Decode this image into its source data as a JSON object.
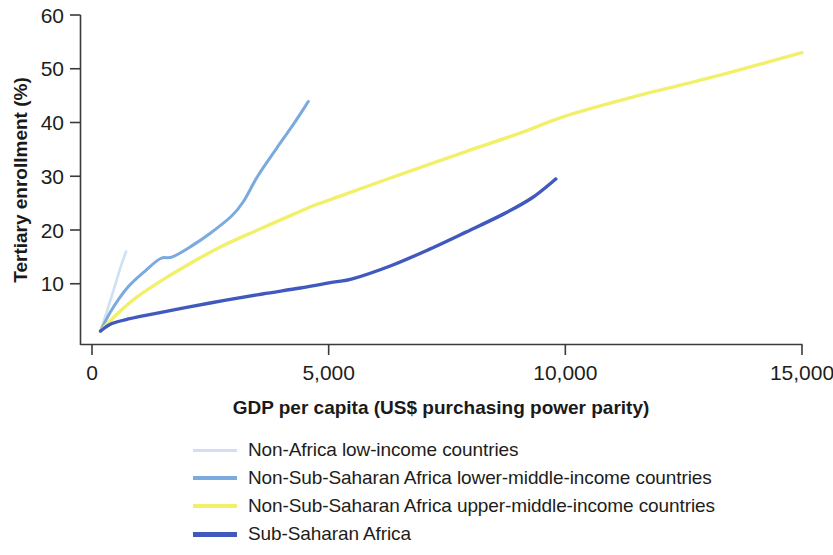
{
  "chart_data": {
    "type": "line",
    "title": "",
    "xlabel": "GDP per capita (US$ purchasing power parity)",
    "ylabel": "Tertiary enrollment (%)",
    "xlim": [
      0,
      15000
    ],
    "ylim": [
      0,
      60
    ],
    "xticks": [
      0,
      5000,
      10000,
      15000
    ],
    "xtick_labels": [
      "0",
      "5,000",
      "10,000",
      "15,000"
    ],
    "yticks": [
      10,
      20,
      30,
      40,
      50,
      60
    ],
    "ytick_labels": [
      "10",
      "20",
      "30",
      "40",
      "50",
      "60"
    ],
    "grid": false,
    "legend_position": "below",
    "series": [
      {
        "name": "Non-Africa low-income countries",
        "color": "#cfe0f5",
        "width": 2.6,
        "points": [
          [
            180,
            1.2
          ],
          [
            320,
            5.0
          ],
          [
            480,
            9.5
          ],
          [
            620,
            13.5
          ],
          [
            720,
            16.0
          ]
        ]
      },
      {
        "name": "Non-Sub-Saharan Africa lower-middle-income countries",
        "color": "#7aaade",
        "width": 3.0,
        "points": [
          [
            180,
            1.2
          ],
          [
            420,
            5.2
          ],
          [
            760,
            9.4
          ],
          [
            1150,
            12.6
          ],
          [
            1450,
            14.7
          ],
          [
            1700,
            15.0
          ],
          [
            2100,
            17.0
          ],
          [
            2500,
            19.4
          ],
          [
            2950,
            22.6
          ],
          [
            3200,
            25.3
          ],
          [
            3500,
            30.0
          ],
          [
            3900,
            35.2
          ],
          [
            4250,
            39.6
          ],
          [
            4570,
            43.9
          ]
        ]
      },
      {
        "name": "Non-Sub-Saharan Africa upper-middle-income countries",
        "color": "#f2f06a",
        "width": 3.4,
        "points": [
          [
            180,
            1.2
          ],
          [
            520,
            4.3
          ],
          [
            900,
            7.2
          ],
          [
            1400,
            10.2
          ],
          [
            2000,
            13.4
          ],
          [
            2700,
            16.8
          ],
          [
            3500,
            20.0
          ],
          [
            4300,
            23.1
          ],
          [
            4700,
            24.6
          ],
          [
            5400,
            26.8
          ],
          [
            6600,
            30.6
          ],
          [
            7900,
            34.6
          ],
          [
            9100,
            38.2
          ],
          [
            10000,
            41.2
          ],
          [
            11500,
            44.9
          ],
          [
            13000,
            48.2
          ],
          [
            14100,
            50.8
          ],
          [
            15000,
            53.0
          ]
        ]
      },
      {
        "name": "Sub-Saharan Africa",
        "color": "#4159bf",
        "width": 3.4,
        "points": [
          [
            180,
            1.2
          ],
          [
            420,
            2.6
          ],
          [
            800,
            3.5
          ],
          [
            1300,
            4.4
          ],
          [
            2000,
            5.6
          ],
          [
            2800,
            6.9
          ],
          [
            3600,
            8.1
          ],
          [
            4400,
            9.2
          ],
          [
            5100,
            10.3
          ],
          [
            5500,
            10.9
          ],
          [
            6300,
            13.3
          ],
          [
            7100,
            16.3
          ],
          [
            7900,
            19.6
          ],
          [
            8700,
            23.0
          ],
          [
            9300,
            26.0
          ],
          [
            9800,
            29.5
          ]
        ]
      }
    ]
  },
  "legend": {
    "items": [
      {
        "label": "Non-Africa low-income countries",
        "color": "#cfe0f5",
        "thickness": 3
      },
      {
        "label": "Non-Sub-Saharan Africa lower-middle-income countries",
        "color": "#7aaade",
        "thickness": 4
      },
      {
        "label": "Non-Sub-Saharan Africa upper-middle-income countries",
        "color": "#f2f06a",
        "thickness": 4
      },
      {
        "label": "Sub-Saharan Africa",
        "color": "#4159bf",
        "thickness": 5
      }
    ]
  }
}
